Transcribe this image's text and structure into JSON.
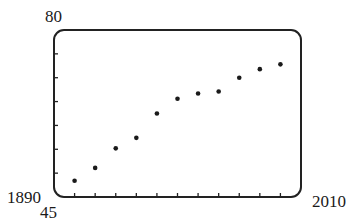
{
  "chart_data": {
    "type": "scatter",
    "title": "",
    "xlabel": "",
    "ylabel": "",
    "xlim": [
      1890,
      2010
    ],
    "ylim": [
      45,
      80
    ],
    "x_tick_step": 10,
    "y_tick_step": 5,
    "grid": false,
    "legend": null,
    "axis_labels": {
      "x_min": "1890",
      "x_max": "2010",
      "y_min": "45",
      "y_max": "80"
    },
    "x": [
      1900,
      1910,
      1920,
      1930,
      1940,
      1950,
      1960,
      1970,
      1980,
      1990,
      2000
    ],
    "y": [
      48.4,
      51.1,
      55.2,
      57.4,
      62.5,
      65.6,
      66.7,
      67.1,
      70.0,
      71.8,
      72.8
    ]
  },
  "style": {
    "frame_color": "#222222",
    "point_color": "#1a1a1a",
    "background": "#ffffff"
  }
}
